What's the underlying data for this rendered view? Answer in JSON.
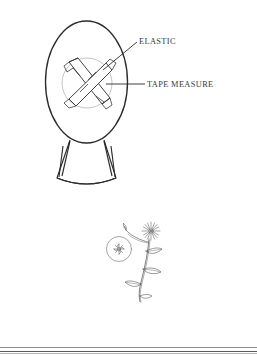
{
  "page": {
    "background_color": "#ffffff",
    "ink_color": "#2b2b2b"
  },
  "garment_figure": {
    "name": "garment-diagram",
    "description": "Line drawing of a rounded garment body with flared skirt and crossed bands over a circular area",
    "parts": [
      {
        "name": "body-oval",
        "label": ""
      },
      {
        "name": "circular-panel",
        "label": ""
      },
      {
        "name": "crossed-band-1",
        "label": ""
      },
      {
        "name": "crossed-band-2",
        "label": ""
      },
      {
        "name": "flared-skirt",
        "label": ""
      }
    ],
    "callouts": [
      {
        "id": "elastic",
        "text": "ELASTIC",
        "leader": "diagonal",
        "target": "crossed-bands"
      },
      {
        "id": "tape-measure",
        "text": "TAPE MEASURE",
        "leader": "horizontal",
        "target": "circular-panel"
      }
    ]
  },
  "botanical_figure": {
    "name": "botanical-illustration",
    "description": "Pen-and-ink botanical drawing of a flowering stem with a star-shaped blossom and a circular magnified detail inset",
    "parts": [
      {
        "name": "star-flower-head",
        "label": ""
      },
      {
        "name": "magnifier-detail-circle",
        "label": ""
      },
      {
        "name": "detail-floret",
        "label": ""
      },
      {
        "name": "stem",
        "label": ""
      },
      {
        "name": "leaf-upper",
        "label": ""
      },
      {
        "name": "leaf-middle",
        "label": ""
      },
      {
        "name": "leaf-lower",
        "label": ""
      },
      {
        "name": "bud",
        "label": ""
      }
    ]
  },
  "footer_rules": {
    "count": 2,
    "colors": [
      "#8e8e8e",
      "#5d5d5d"
    ]
  }
}
